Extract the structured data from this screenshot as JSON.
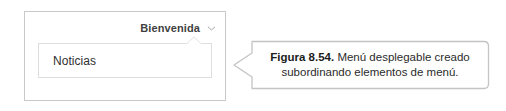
{
  "figure": {
    "mock": {
      "menubar": {
        "item_label": "Bienvenida",
        "chevron_icon": "chevron-down-icon"
      },
      "dropdown": {
        "items": [
          {
            "label": "Noticias"
          }
        ]
      }
    },
    "caption": {
      "figure_number": "Figura 8.54.",
      "line_1": "Menú desplegable creado",
      "line_2": "subordinando elementos de menú.",
      "full_text": "Figura 8.54. Menú desplegable creado subordinando elementos de menú."
    }
  },
  "colors": {
    "page_background": "#ffffff",
    "frame_border": "#c9c9c9",
    "panel_border": "#dedede",
    "callout_border": "#c4c4c4",
    "menu_label_text": "#3f3f3f",
    "item_text": "#2f2f2f",
    "caption_text": "#2b2b2b"
  }
}
